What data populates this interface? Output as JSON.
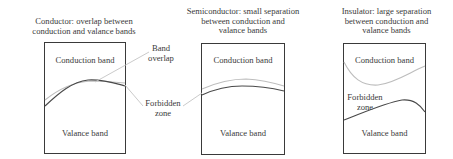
{
  "panels": [
    {
      "id": "conductor",
      "title_line1": "Conductor: overlap between",
      "title_line2": "conduction and valance bands",
      "title_line3": "",
      "conduction_label": "Conduction band",
      "valance_label": "Valance band"
    },
    {
      "id": "semiconductor",
      "title_line1": "Semiconductor: small separation",
      "title_line2": "between conduction and",
      "title_line3": "valance bands",
      "conduction_label": "Conduction band",
      "valance_label": "Valance band"
    },
    {
      "id": "insulator",
      "title_line1": "Insulator: large separation",
      "title_line2": "between conduction and",
      "title_line3": "valance bands",
      "conduction_label": "Conduction band",
      "valance_label": "Valance band",
      "forbidden_line1": "Forbidden",
      "forbidden_line2": "zone"
    }
  ],
  "callouts": {
    "band_overlap_line1": "Band",
    "band_overlap_line2": "overlap",
    "forbidden_line1": "Forbidden",
    "forbidden_line2": "zone"
  },
  "colors": {
    "box_border": "#3a3a3a",
    "valence_band_edge": "#4a4a4a",
    "conduction_band_edge": "#bdbdbd",
    "leader_line": "#c4c4c4",
    "text": "#3a3a3a"
  }
}
